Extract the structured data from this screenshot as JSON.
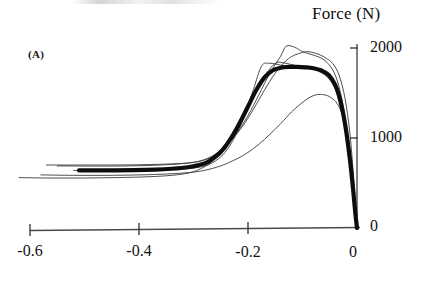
{
  "panel": {
    "label": "(A)"
  },
  "axis_titles": {
    "y": "Force (N)"
  },
  "ticks": {
    "y": [
      "2000",
      "1000",
      "0"
    ],
    "x": [
      "-0.6",
      "-0.4",
      "-0.2",
      "0"
    ]
  },
  "colors": {
    "ink": "#111111",
    "axis": "#4a4a4a",
    "thin_trace": "#3a3a3a",
    "thick_trace": "#0d0d0d",
    "background": "#ffffff"
  },
  "chart_data": {
    "type": "line",
    "title": "",
    "subtitle": "",
    "panel_label": "(A)",
    "xlabel": "",
    "ylabel": "Force (N)",
    "xlim": [
      -0.66,
      0.02
    ],
    "ylim": [
      -60,
      2150
    ],
    "xticks": [
      -0.6,
      -0.4,
      -0.2,
      0
    ],
    "yticks": [
      0,
      1000,
      2000
    ],
    "grid": false,
    "legend": false,
    "legend_position": "none",
    "axis_style": "left-and-bottom-spines-only",
    "series": [
      {
        "name": "trial-1",
        "style": "thin",
        "peak_value": 2020,
        "peak_x": -0.13,
        "x": [
          -0.57,
          -0.5,
          -0.44,
          -0.38,
          -0.33,
          -0.3,
          -0.28,
          -0.26,
          -0.24,
          -0.22,
          -0.2,
          -0.18,
          -0.16,
          -0.14,
          -0.13,
          -0.115,
          -0.1,
          -0.085,
          -0.07,
          -0.055,
          -0.04,
          -0.028,
          -0.018,
          -0.009,
          -0.003,
          0
        ],
        "y": [
          700,
          700,
          700,
          705,
          715,
          730,
          760,
          820,
          920,
          1060,
          1250,
          1480,
          1720,
          1910,
          2020,
          2010,
          1960,
          1930,
          1900,
          1840,
          1700,
          1440,
          1060,
          560,
          180,
          0
        ]
      },
      {
        "name": "trial-2",
        "style": "thin",
        "peak_value": 1960,
        "peak_x": -0.09,
        "x": [
          -0.55,
          -0.48,
          -0.42,
          -0.36,
          -0.32,
          -0.29,
          -0.27,
          -0.25,
          -0.23,
          -0.21,
          -0.19,
          -0.17,
          -0.15,
          -0.13,
          -0.115,
          -0.1,
          -0.09,
          -0.075,
          -0.06,
          -0.045,
          -0.033,
          -0.022,
          -0.013,
          -0.006,
          -0.002,
          0
        ],
        "y": [
          690,
          688,
          690,
          700,
          715,
          740,
          780,
          860,
          980,
          1130,
          1320,
          1530,
          1720,
          1860,
          1920,
          1950,
          1960,
          1940,
          1900,
          1830,
          1700,
          1440,
          1050,
          540,
          160,
          0
        ]
      },
      {
        "name": "trial-3",
        "style": "thin",
        "peak_value": 1830,
        "peak_x": -0.15,
        "x": [
          -0.62,
          -0.56,
          -0.5,
          -0.44,
          -0.38,
          -0.34,
          -0.31,
          -0.29,
          -0.27,
          -0.25,
          -0.23,
          -0.21,
          -0.19,
          -0.17,
          -0.15,
          -0.13,
          -0.11,
          -0.095,
          -0.08,
          -0.065,
          -0.05,
          -0.036,
          -0.024,
          -0.014,
          -0.006,
          -0.002,
          0
        ],
        "y": [
          560,
          555,
          555,
          560,
          570,
          585,
          610,
          650,
          720,
          840,
          1010,
          1230,
          1470,
          1680,
          1830,
          1830,
          1800,
          1790,
          1780,
          1750,
          1680,
          1530,
          1270,
          880,
          400,
          130,
          0
        ]
      },
      {
        "name": "trial-4",
        "style": "thin",
        "peak_value": 1800,
        "peak_x": -0.175,
        "x": [
          -0.52,
          -0.46,
          -0.41,
          -0.36,
          -0.32,
          -0.29,
          -0.27,
          -0.25,
          -0.235,
          -0.22,
          -0.205,
          -0.19,
          -0.175,
          -0.16,
          -0.14,
          -0.12,
          -0.1,
          -0.085,
          -0.07,
          -0.055,
          -0.042,
          -0.03,
          -0.02,
          -0.011,
          -0.004,
          0
        ],
        "y": [
          640,
          638,
          640,
          645,
          655,
          675,
          710,
          790,
          900,
          1060,
          1270,
          1540,
          1800,
          1830,
          1810,
          1790,
          1780,
          1770,
          1740,
          1680,
          1570,
          1370,
          1030,
          600,
          220,
          0
        ]
      },
      {
        "name": "trial-5",
        "style": "thin",
        "peak_value": 1480,
        "peak_x": -0.07,
        "x": [
          -0.58,
          -0.52,
          -0.46,
          -0.4,
          -0.35,
          -0.31,
          -0.28,
          -0.25,
          -0.22,
          -0.2,
          -0.18,
          -0.16,
          -0.14,
          -0.12,
          -0.105,
          -0.09,
          -0.075,
          -0.06,
          -0.048,
          -0.036,
          -0.026,
          -0.016,
          -0.008,
          -0.003,
          0
        ],
        "y": [
          590,
          585,
          585,
          590,
          600,
          615,
          640,
          690,
          770,
          840,
          930,
          1040,
          1160,
          1290,
          1370,
          1440,
          1480,
          1480,
          1450,
          1380,
          1240,
          990,
          600,
          230,
          0
        ]
      },
      {
        "name": "mean-thick",
        "style": "thick",
        "peak_value": 1790,
        "peak_x": -0.125,
        "x": [
          -0.51,
          -0.46,
          -0.41,
          -0.37,
          -0.34,
          -0.31,
          -0.29,
          -0.275,
          -0.26,
          -0.245,
          -0.23,
          -0.215,
          -0.2,
          -0.185,
          -0.17,
          -0.155,
          -0.14,
          -0.125,
          -0.11,
          -0.095,
          -0.08,
          -0.065,
          -0.052,
          -0.04,
          -0.03,
          -0.021,
          -0.013,
          -0.007,
          -0.003,
          0
        ],
        "y": [
          640,
          640,
          642,
          648,
          658,
          675,
          700,
          730,
          790,
          880,
          1010,
          1170,
          1350,
          1530,
          1670,
          1750,
          1780,
          1790,
          1790,
          1785,
          1775,
          1750,
          1700,
          1590,
          1400,
          1120,
          760,
          420,
          160,
          0
        ]
      }
    ]
  },
  "plot_geometry": {
    "origin_px": {
      "x": 357,
      "y": 228
    },
    "px_per_unit_x": 545,
    "px_per_unit_y": 0.09
  }
}
